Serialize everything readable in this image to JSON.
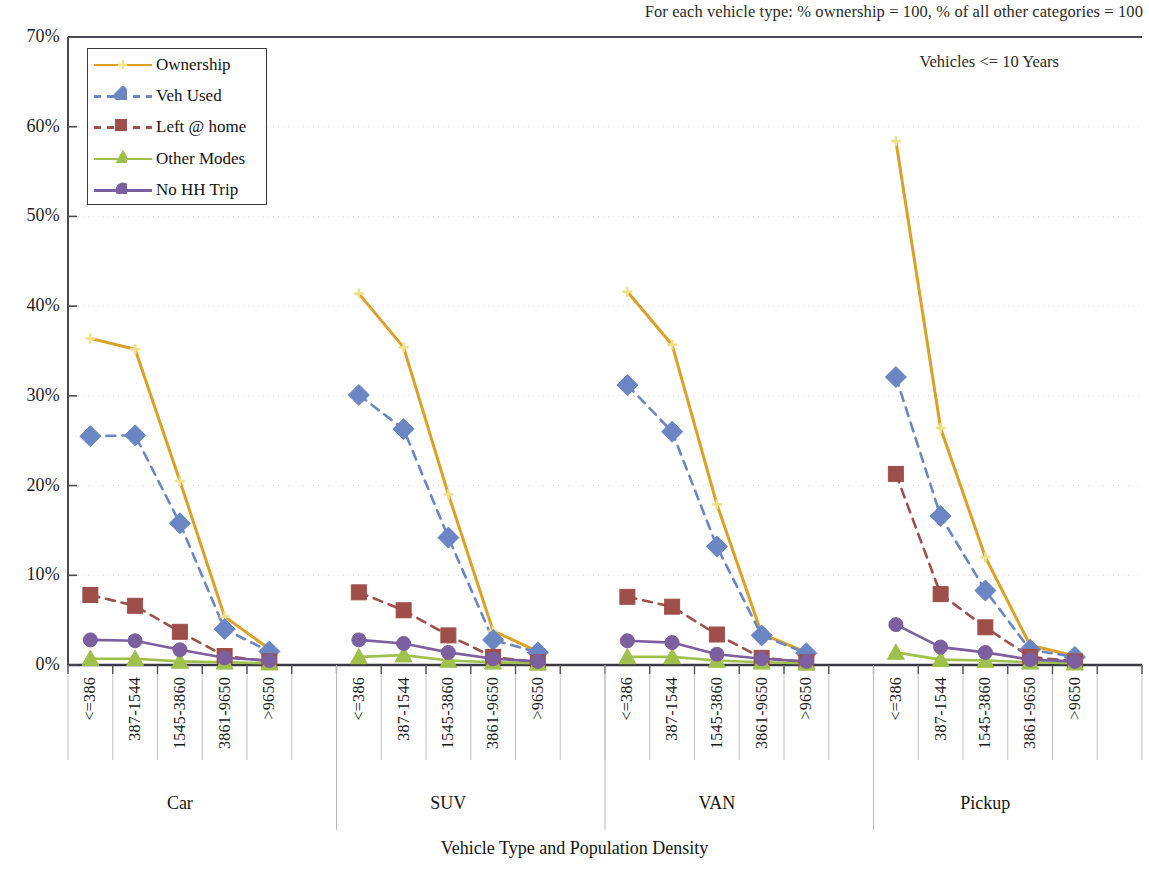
{
  "annotations": {
    "top_note": "For each vehicle type: % ownership = 100, % of all other categories = 100",
    "sub_note": "Vehicles <= 10 Years"
  },
  "axis": {
    "x_title": "Vehicle Type and Population Density",
    "y_ticks": [
      "0%",
      "10%",
      "20%",
      "30%",
      "40%",
      "50%",
      "60%",
      "70%"
    ]
  },
  "legend": {
    "items": [
      {
        "label": "Ownership",
        "color": "#d9a227",
        "style": "solid",
        "marker": "cross"
      },
      {
        "label": "Veh Used",
        "color": "#6b86c4",
        "style": "dashed",
        "marker": "diamond"
      },
      {
        "label": "Left @ home",
        "color": "#9e4f4a",
        "style": "dashed",
        "marker": "square"
      },
      {
        "label": "Other Modes",
        "color": "#9fc04a",
        "style": "solid",
        "marker": "triangle"
      },
      {
        "label": "No HH Trip",
        "color": "#7c5f9e",
        "style": "solid",
        "marker": "circle"
      }
    ]
  },
  "chart_data": {
    "type": "line",
    "title": "",
    "xlabel": "Vehicle Type and Population Density",
    "ylabel": "",
    "ylim": [
      0,
      70
    ],
    "ytick_step": 10,
    "grid": true,
    "legend_position": "top-left",
    "groups": [
      "Car",
      "SUV",
      "VAN",
      "Pickup"
    ],
    "density_bins": [
      "<=386",
      "387-1544",
      "1545-3860",
      "3861-9650",
      ">9650"
    ],
    "categories": [
      "Car <=386",
      "Car 387-1544",
      "Car 1545-3860",
      "Car 3861-9650",
      "Car >9650",
      "SUV <=386",
      "SUV 387-1544",
      "SUV 1545-3860",
      "SUV 3861-9650",
      "SUV >9650",
      "VAN <=386",
      "VAN 387-1544",
      "VAN 1545-3860",
      "VAN 3861-9650",
      "VAN >9650",
      "Pickup <=386",
      "Pickup 387-1544",
      "Pickup 1545-3860",
      "Pickup 3861-9650",
      "Pickup >9650"
    ],
    "series": [
      {
        "name": "Ownership",
        "color": "#d9a227",
        "style": "solid",
        "marker": "cross",
        "values": [
          36.4,
          35.2,
          20.5,
          5.4,
          1.8,
          41.4,
          35.4,
          19.0,
          3.8,
          1.5,
          41.6,
          35.7,
          17.9,
          3.5,
          1.4,
          58.4,
          26.4,
          12.0,
          2.2,
          1.0
        ]
      },
      {
        "name": "Veh Used",
        "color": "#6b86c4",
        "style": "dashed",
        "marker": "diamond",
        "values": [
          25.5,
          25.6,
          15.8,
          4.0,
          1.5,
          30.1,
          26.3,
          14.2,
          2.8,
          1.4,
          31.2,
          26.0,
          13.2,
          3.3,
          1.3,
          32.1,
          16.6,
          8.3,
          1.7,
          0.9
        ]
      },
      {
        "name": "Left @ home",
        "color": "#9e4f4a",
        "style": "dashed",
        "marker": "square",
        "values": [
          7.8,
          6.6,
          3.7,
          1.0,
          0.4,
          8.1,
          6.1,
          3.3,
          0.9,
          0.3,
          7.6,
          6.5,
          3.4,
          0.8,
          0.3,
          21.3,
          7.9,
          4.2,
          0.9,
          0.4
        ]
      },
      {
        "name": "Other Modes",
        "color": "#9fc04a",
        "style": "solid",
        "marker": "triangle",
        "values": [
          0.7,
          0.7,
          0.4,
          0.3,
          0.2,
          0.9,
          1.1,
          0.5,
          0.3,
          0.2,
          0.9,
          0.9,
          0.5,
          0.3,
          0.2,
          1.4,
          0.6,
          0.5,
          0.3,
          0.2
        ]
      },
      {
        "name": "No HH Trip",
        "color": "#7c5f9e",
        "style": "solid",
        "marker": "circle",
        "values": [
          2.8,
          2.7,
          1.7,
          0.8,
          0.5,
          2.8,
          2.4,
          1.4,
          0.7,
          0.4,
          2.7,
          2.5,
          1.2,
          0.7,
          0.4,
          4.5,
          2.0,
          1.4,
          0.6,
          0.4
        ]
      }
    ]
  }
}
